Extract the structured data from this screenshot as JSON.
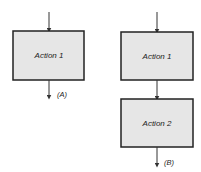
{
  "diagram_a": {
    "action1": "Action 1",
    "output_label": "(A)"
  },
  "diagram_b": {
    "action1": "Action 1",
    "action2": "Action 2",
    "output_label": "(B)"
  }
}
